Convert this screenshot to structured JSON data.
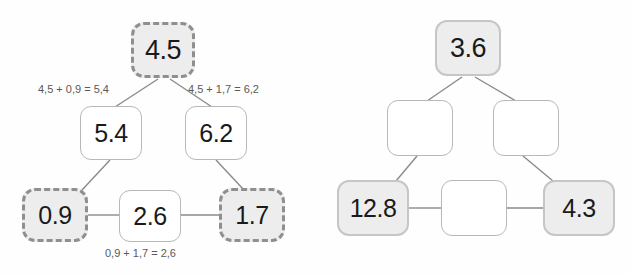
{
  "canvas": {
    "width": 631,
    "height": 275,
    "background": "#fefefe"
  },
  "colors": {
    "shaded_fill": "#ededed",
    "plain_fill": "#ffffff",
    "dashed_border": "#8f8f8f",
    "solid_border": "#c6c6c6",
    "thin_border": "#b8b8b8",
    "link_line": "#8a8a8a",
    "value_text": "#1a1a1a",
    "annotation_text": "#5a5a5a"
  },
  "diagrams": [
    {
      "id": "worked-example",
      "name": "left-worked-example",
      "nodes": [
        {
          "id": "left-top",
          "label": "4.5",
          "style": "shaded-dashed",
          "x": 131,
          "y": 22,
          "w": 64,
          "h": 56,
          "font_size": 27
        },
        {
          "id": "left-mid-left",
          "label": "5.4",
          "style": "plain",
          "x": 80,
          "y": 106,
          "w": 62,
          "h": 54,
          "font_size": 25
        },
        {
          "id": "left-mid-right",
          "label": "6.2",
          "style": "plain",
          "x": 185,
          "y": 106,
          "w": 62,
          "h": 54,
          "font_size": 25
        },
        {
          "id": "left-bottom-left",
          "label": "0.9",
          "style": "shaded-dashed",
          "x": 22,
          "y": 188,
          "w": 66,
          "h": 54,
          "font_size": 25
        },
        {
          "id": "left-bottom-mid",
          "label": "2.6",
          "style": "plain",
          "x": 119,
          "y": 190,
          "w": 62,
          "h": 52,
          "font_size": 25
        },
        {
          "id": "left-bottom-right",
          "label": "1.7",
          "style": "shaded-dashed",
          "x": 219,
          "y": 188,
          "w": 66,
          "h": 54,
          "font_size": 25
        }
      ],
      "links": [
        {
          "id": "l-top-to-midleft",
          "x1": 158,
          "y1": 79,
          "x2": 115,
          "y2": 107
        },
        {
          "id": "l-top-to-midright",
          "x1": 170,
          "y1": 79,
          "x2": 212,
          "y2": 107
        },
        {
          "id": "l-midleft-to-bl",
          "x1": 110,
          "y1": 160,
          "x2": 82,
          "y2": 190
        },
        {
          "id": "l-midright-to-br",
          "x1": 216,
          "y1": 160,
          "x2": 244,
          "y2": 190
        },
        {
          "id": "l-bl-to-bm",
          "x1": 88,
          "y1": 215,
          "x2": 119,
          "y2": 215
        },
        {
          "id": "l-bm-to-br",
          "x1": 181,
          "y1": 215,
          "x2": 219,
          "y2": 215
        }
      ],
      "annotations": [
        {
          "id": "annot-left",
          "text": "4,5 + 0,9 = 5,4",
          "x": 38,
          "y": 83
        },
        {
          "id": "annot-right",
          "text": "4,5 + 1,7 = 6,2",
          "x": 188,
          "y": 83
        },
        {
          "id": "annot-bottom",
          "text": "0,9 + 1,7 = 2,6",
          "x": 105,
          "y": 247
        }
      ]
    },
    {
      "id": "exercise",
      "name": "right-exercise",
      "nodes": [
        {
          "id": "right-top",
          "label": "3.6",
          "style": "shaded-solid",
          "x": 435,
          "y": 20,
          "w": 66,
          "h": 56,
          "font_size": 27
        },
        {
          "id": "right-mid-left",
          "label": "",
          "style": "plain",
          "x": 387,
          "y": 100,
          "w": 66,
          "h": 56,
          "font_size": 25
        },
        {
          "id": "right-mid-right",
          "label": "",
          "style": "plain",
          "x": 493,
          "y": 100,
          "w": 66,
          "h": 56,
          "font_size": 25
        },
        {
          "id": "right-bottom-left",
          "label": "12.8",
          "style": "shaded-solid",
          "x": 337,
          "y": 180,
          "w": 72,
          "h": 56,
          "font_size": 25
        },
        {
          "id": "right-bottom-mid",
          "label": "",
          "style": "plain",
          "x": 441,
          "y": 180,
          "w": 66,
          "h": 56,
          "font_size": 25
        },
        {
          "id": "right-bottom-right",
          "label": "4.3",
          "style": "shaded-solid",
          "x": 543,
          "y": 180,
          "w": 72,
          "h": 56,
          "font_size": 25
        }
      ],
      "links": [
        {
          "id": "r-top-to-midleft",
          "x1": 462,
          "y1": 77,
          "x2": 427,
          "y2": 101
        },
        {
          "id": "r-top-to-midright",
          "x1": 475,
          "y1": 77,
          "x2": 516,
          "y2": 101
        },
        {
          "id": "r-midleft-to-bl",
          "x1": 417,
          "y1": 156,
          "x2": 396,
          "y2": 181
        },
        {
          "id": "r-midright-to-br",
          "x1": 523,
          "y1": 156,
          "x2": 553,
          "y2": 181
        },
        {
          "id": "r-bl-to-bm",
          "x1": 409,
          "y1": 208,
          "x2": 441,
          "y2": 208
        },
        {
          "id": "r-bm-to-br",
          "x1": 507,
          "y1": 208,
          "x2": 543,
          "y2": 208
        }
      ],
      "annotations": []
    }
  ]
}
